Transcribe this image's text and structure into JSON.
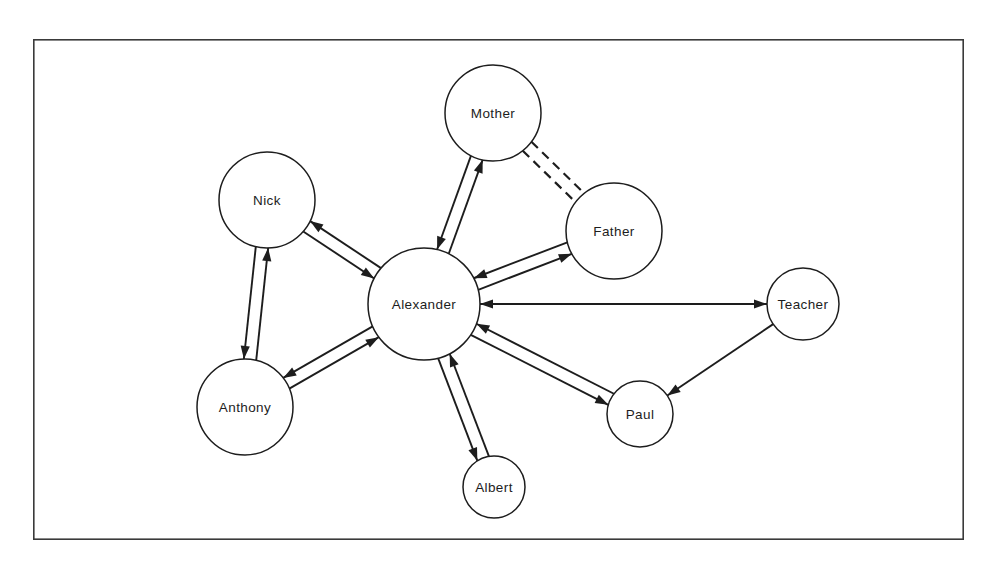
{
  "diagram": {
    "type": "sociogram",
    "title": "",
    "frame": {
      "x": 33,
      "y": 39,
      "width": 931,
      "height": 501,
      "border_color": "#3a3a3a"
    },
    "line_color": "#1d1d1d",
    "background_color": "#ffffff",
    "nodes": [
      {
        "id": "nick",
        "label": "Nick",
        "cx": 267,
        "cy": 200,
        "r": 48
      },
      {
        "id": "mother",
        "label": "Mother",
        "cx": 493,
        "cy": 113,
        "r": 48
      },
      {
        "id": "father",
        "label": "Father",
        "cx": 614,
        "cy": 231,
        "r": 48
      },
      {
        "id": "alexander",
        "label": "Alexander",
        "cx": 424,
        "cy": 304,
        "r": 56
      },
      {
        "id": "anthony",
        "label": "Anthony",
        "cx": 245,
        "cy": 407,
        "r": 48
      },
      {
        "id": "albert",
        "label": "Albert",
        "cx": 494,
        "cy": 487,
        "r": 31
      },
      {
        "id": "paul",
        "label": "Paul",
        "cx": 640,
        "cy": 414,
        "r": 33
      },
      {
        "id": "teacher",
        "label": "Teacher",
        "cx": 803,
        "cy": 304,
        "r": 36
      }
    ],
    "edges": [
      {
        "id": "alexander-nick",
        "from": "alexander",
        "to": "nick",
        "style": "solid",
        "direction": "bidirectional",
        "rendering": "double-line"
      },
      {
        "id": "alexander-mother",
        "from": "alexander",
        "to": "mother",
        "style": "solid",
        "direction": "bidirectional",
        "rendering": "double-line"
      },
      {
        "id": "alexander-father",
        "from": "alexander",
        "to": "father",
        "style": "solid",
        "direction": "bidirectional",
        "rendering": "double-line"
      },
      {
        "id": "alexander-anthony",
        "from": "alexander",
        "to": "anthony",
        "style": "solid",
        "direction": "bidirectional",
        "rendering": "double-line"
      },
      {
        "id": "alexander-albert",
        "from": "alexander",
        "to": "albert",
        "style": "solid",
        "direction": "bidirectional",
        "rendering": "double-line"
      },
      {
        "id": "alexander-paul",
        "from": "alexander",
        "to": "paul",
        "style": "solid",
        "direction": "bidirectional",
        "rendering": "double-line"
      },
      {
        "id": "nick-anthony",
        "from": "nick",
        "to": "anthony",
        "style": "solid",
        "direction": "bidirectional",
        "rendering": "double-line"
      },
      {
        "id": "mother-father",
        "from": "mother",
        "to": "father",
        "style": "dashed",
        "direction": "none",
        "rendering": "double-line"
      },
      {
        "id": "alexander-teacher",
        "from": "alexander",
        "to": "teacher",
        "style": "solid",
        "direction": "forward",
        "rendering": "single-line"
      },
      {
        "id": "teacher-alexander",
        "from": "teacher",
        "to": "alexander",
        "style": "dashed",
        "direction": "forward",
        "rendering": "single-line"
      },
      {
        "id": "teacher-paul",
        "from": "teacher",
        "to": "paul",
        "style": "solid",
        "direction": "forward",
        "rendering": "single-line"
      }
    ]
  }
}
